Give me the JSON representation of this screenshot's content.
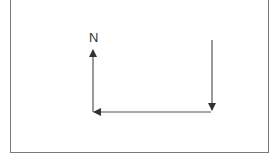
{
  "diagram": {
    "labels": {
      "north": "N"
    },
    "stroke_color": "#555555",
    "frame_color": "#7a7a7a",
    "arrows": [
      {
        "name": "down-arrow",
        "from": [
          212,
          40
        ],
        "to": [
          212,
          110
        ]
      },
      {
        "name": "left-arrow",
        "from": [
          211,
          112
        ],
        "to": [
          94,
          112
        ]
      },
      {
        "name": "up-arrow",
        "from": [
          93,
          112
        ],
        "to": [
          93,
          50
        ]
      }
    ]
  }
}
